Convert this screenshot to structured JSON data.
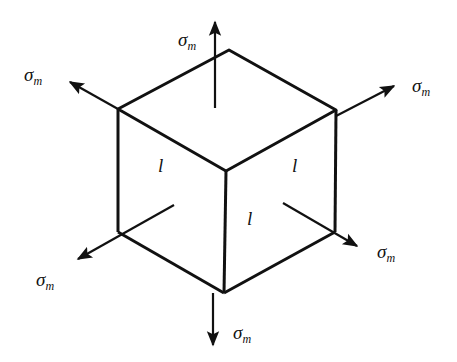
{
  "diagram": {
    "title": "",
    "stress_symbol": "σ",
    "stress_subscript": "m",
    "edge_label": "l",
    "arrows": [
      {
        "id": "top",
        "label": "σm"
      },
      {
        "id": "upper-left",
        "label": "σm"
      },
      {
        "id": "upper-right",
        "label": "σm"
      },
      {
        "id": "lower-left",
        "label": "σm"
      },
      {
        "id": "lower-right",
        "label": "σm"
      },
      {
        "id": "bottom",
        "label": "σm"
      }
    ],
    "face_labels": [
      {
        "face": "left",
        "label": "l"
      },
      {
        "face": "right",
        "label": "l"
      },
      {
        "face": "front",
        "label": "l"
      }
    ],
    "colors": {
      "line": "#111111",
      "background": "#ffffff"
    }
  }
}
